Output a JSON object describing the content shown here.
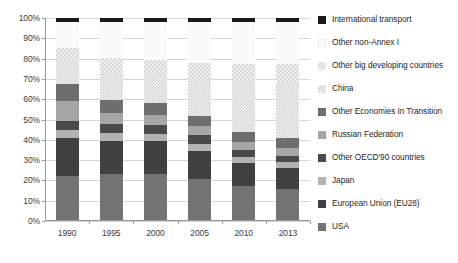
{
  "chart_data": {
    "type": "bar",
    "subtype": "stacked-percentage",
    "title": "",
    "xlabel": "",
    "ylabel": "",
    "ylim": [
      0,
      100
    ],
    "grid": true,
    "legend_position": "right",
    "categories": [
      "1990",
      "1995",
      "2000",
      "2005",
      "2010",
      "2013"
    ],
    "ytick_labels": [
      "0%",
      "10%",
      "20%",
      "30%",
      "40%",
      "50%",
      "60%",
      "70%",
      "80%",
      "90%",
      "100%"
    ],
    "ytick_values": [
      0,
      10,
      20,
      30,
      40,
      50,
      60,
      70,
      80,
      90,
      100
    ],
    "series": [
      {
        "name": "USA",
        "color": "#737373",
        "pattern": "solid",
        "values": [
          22.3,
          23.0,
          23.2,
          20.8,
          17.2,
          16.0
        ]
      },
      {
        "name": "European Union (EU28)",
        "color": "#404040",
        "pattern": "solid",
        "values": [
          18.7,
          16.6,
          16.1,
          13.9,
          11.3,
          10.0
        ]
      },
      {
        "name": "Japan",
        "color": "#b3b3b3",
        "pattern": "solid",
        "values": [
          3.8,
          3.9,
          3.7,
          3.3,
          2.8,
          3.0
        ]
      },
      {
        "name": "Other OECD'90 countries",
        "color": "#4a4a4a",
        "pattern": "solid",
        "values": [
          4.5,
          4.4,
          4.4,
          4.2,
          3.6,
          3.2
        ]
      },
      {
        "name": "Russian Federation",
        "color": "#a6a6a6",
        "pattern": "solid",
        "values": [
          9.6,
          5.4,
          4.9,
          4.5,
          4.2,
          4.0
        ]
      },
      {
        "name": "Other Economies In Transition",
        "color": "#6e6e6e",
        "pattern": "solid",
        "values": [
          8.8,
          6.4,
          5.9,
          5.2,
          4.8,
          4.5
        ]
      },
      {
        "name": "China",
        "color": "#f4f4f4",
        "pattern": "hatch",
        "values": [
          11.4,
          13.6,
          13.8,
          18.0,
          25.0,
          27.8
        ]
      },
      {
        "name": "Other big developing countries",
        "color": "#f0f0f0",
        "pattern": "checker",
        "values": [
          6.3,
          6.9,
          7.3,
          7.8,
          8.4,
          9.0
        ]
      },
      {
        "name": "Other non-Annex I",
        "color": "#fafafa",
        "pattern": "solid",
        "values": [
          12.6,
          17.8,
          18.7,
          20.3,
          20.7,
          20.5
        ]
      },
      {
        "name": "International transport",
        "color": "#1a1a1a",
        "pattern": "solid",
        "values": [
          2.0,
          2.0,
          2.0,
          2.0,
          2.0,
          2.0
        ]
      }
    ],
    "legend_order_top_to_bottom": [
      "International transport",
      "Other non-Annex I",
      "Other big developing countries",
      "China",
      "Other Economies In Transition",
      "Russian Federation",
      "Other OECD'90 countries",
      "Japan",
      "European Union (EU28)",
      "USA"
    ]
  },
  "legend": {
    "items": [
      {
        "label": "International transport",
        "key": "intl-transport"
      },
      {
        "label": "Other non-Annex I",
        "key": "other-nonannex"
      },
      {
        "label": "Other big developing countries",
        "key": "other-big-dev"
      },
      {
        "label": "China",
        "key": "china"
      },
      {
        "label": "Other Economies In Transition",
        "key": "other-eit"
      },
      {
        "label": "Russian Federation",
        "key": "russia"
      },
      {
        "label": "Other OECD'90 countries",
        "key": "other-oecd"
      },
      {
        "label": "Japan",
        "key": "japan"
      },
      {
        "label": "European Union (EU28)",
        "key": "eu28"
      },
      {
        "label": "USA",
        "key": "usa"
      }
    ]
  },
  "footnote": {
    "text": ""
  }
}
